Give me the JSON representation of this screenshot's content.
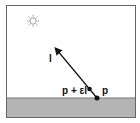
{
  "diagram": {
    "labels": {
      "direction": "l",
      "offset_point": "p + εl",
      "point": "p"
    },
    "icons": {
      "light_source": "sun-icon"
    },
    "colors": {
      "ground": "#b4b4b4",
      "frame": "#555555",
      "ink": "#111111"
    }
  }
}
